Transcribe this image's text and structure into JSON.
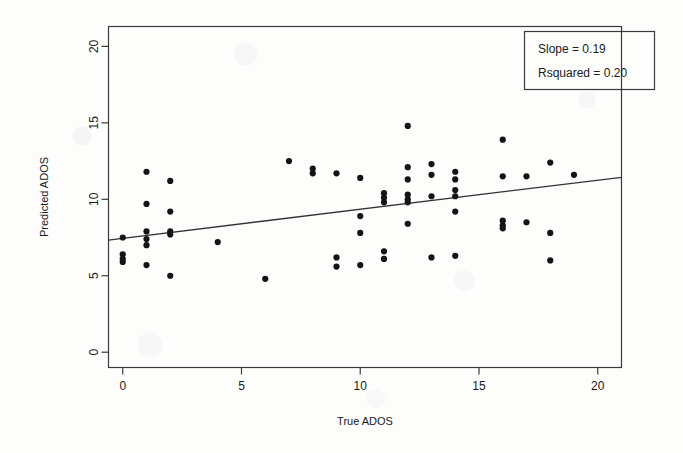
{
  "chart_data": {
    "type": "scatter",
    "title": "",
    "xlabel": "True ADOS",
    "ylabel": "Predicted ADOS",
    "xlim": [
      -0.6,
      21.0
    ],
    "ylim": [
      -1.0,
      21.3
    ],
    "xticks": [
      0,
      5,
      10,
      15,
      20
    ],
    "yticks": [
      0,
      5,
      10,
      15,
      20
    ],
    "xtick_labels": [
      "0",
      "5",
      "10",
      "15",
      "20"
    ],
    "ytick_labels": [
      "0",
      "5",
      "10",
      "15",
      "20"
    ],
    "grid": false,
    "legend_position": "top-right",
    "points": [
      [
        0,
        7.5
      ],
      [
        0,
        6.4
      ],
      [
        0,
        6.1
      ],
      [
        0,
        5.9
      ],
      [
        1,
        11.8
      ],
      [
        1,
        9.7
      ],
      [
        1,
        7.9
      ],
      [
        1,
        7.4
      ],
      [
        1,
        7.0
      ],
      [
        1,
        5.7
      ],
      [
        2,
        11.2
      ],
      [
        2,
        9.2
      ],
      [
        2,
        7.9
      ],
      [
        2,
        7.7
      ],
      [
        2,
        5.0
      ],
      [
        4,
        7.2
      ],
      [
        6,
        4.8
      ],
      [
        7,
        12.5
      ],
      [
        8,
        12.0
      ],
      [
        8,
        11.7
      ],
      [
        9,
        11.7
      ],
      [
        9,
        6.2
      ],
      [
        9,
        5.6
      ],
      [
        10,
        11.4
      ],
      [
        10,
        8.9
      ],
      [
        10,
        7.8
      ],
      [
        10,
        5.7
      ],
      [
        11,
        10.4
      ],
      [
        11,
        10.1
      ],
      [
        11,
        9.8
      ],
      [
        11,
        6.6
      ],
      [
        11,
        6.1
      ],
      [
        12,
        14.8
      ],
      [
        12,
        12.1
      ],
      [
        12,
        11.3
      ],
      [
        12,
        10.3
      ],
      [
        12,
        10.0
      ],
      [
        12,
        9.8
      ],
      [
        12,
        8.4
      ],
      [
        13,
        12.3
      ],
      [
        13,
        11.6
      ],
      [
        13,
        10.2
      ],
      [
        13,
        6.2
      ],
      [
        14,
        11.8
      ],
      [
        14,
        11.3
      ],
      [
        14,
        10.6
      ],
      [
        14,
        10.2
      ],
      [
        14,
        9.2
      ],
      [
        14,
        6.3
      ],
      [
        16,
        13.9
      ],
      [
        16,
        11.5
      ],
      [
        16,
        8.6
      ],
      [
        16,
        8.3
      ],
      [
        16,
        8.1
      ],
      [
        17,
        11.5
      ],
      [
        17,
        8.5
      ],
      [
        18,
        12.4
      ],
      [
        18,
        7.8
      ],
      [
        18,
        6.0
      ],
      [
        19,
        11.6
      ]
    ],
    "fit_line": {
      "slope": 0.19,
      "intercept": 7.45,
      "x_start": -0.6,
      "x_end": 21.0
    },
    "annotations": {
      "slope_label": "Slope = 0.19",
      "rsquared_label": "Rsquared = 0.20"
    }
  }
}
